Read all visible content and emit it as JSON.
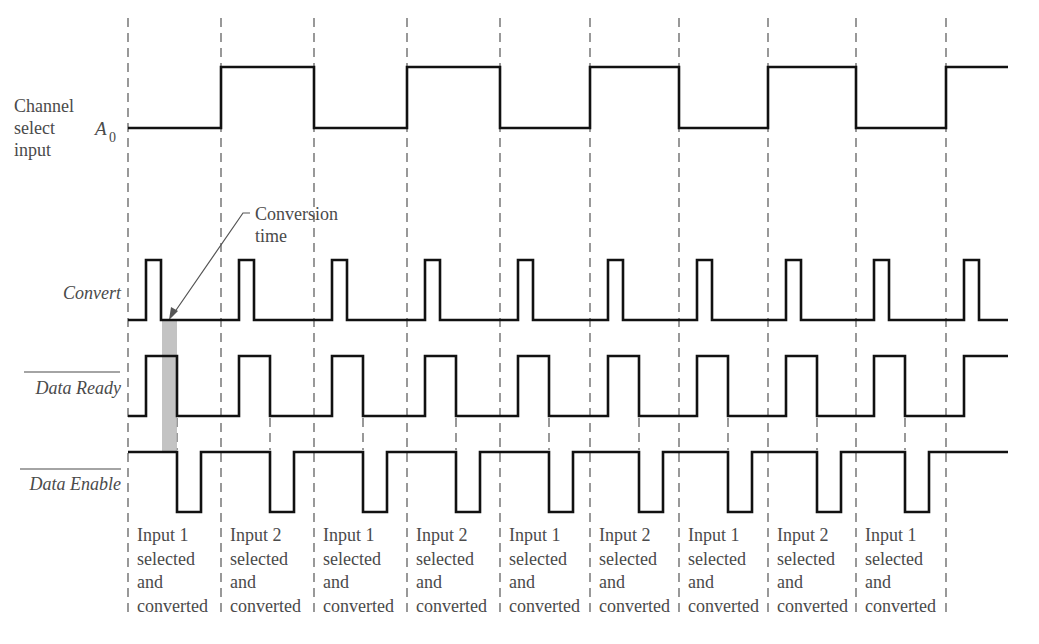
{
  "signals": [
    {
      "id": "a0",
      "label_lines": [
        "Channel",
        "select",
        "input"
      ],
      "symbol": "A",
      "symbol_sub": "0"
    },
    {
      "id": "convert",
      "label": "Convert"
    },
    {
      "id": "data_ready",
      "label": "Data Ready",
      "overbar": true
    },
    {
      "id": "data_enable",
      "label": "Data Enable",
      "overbar": true
    }
  ],
  "annotation": {
    "lines": [
      "Conversion",
      "time"
    ]
  },
  "slots": [
    {
      "lines": [
        "Input 1",
        "selected",
        "and",
        "converted"
      ]
    },
    {
      "lines": [
        "Input 2",
        "selected",
        "and",
        "converted"
      ]
    },
    {
      "lines": [
        "Input 1",
        "selected",
        "and",
        "converted"
      ]
    },
    {
      "lines": [
        "Input 2",
        "selected",
        "and",
        "converted"
      ]
    },
    {
      "lines": [
        "Input 1",
        "selected",
        "and",
        "converted"
      ]
    },
    {
      "lines": [
        "Input 2",
        "selected",
        "and",
        "converted"
      ]
    },
    {
      "lines": [
        "Input 1",
        "selected",
        "and",
        "converted"
      ]
    },
    {
      "lines": [
        "Input 2",
        "selected",
        "and",
        "converted"
      ]
    },
    {
      "lines": [
        "Input 1",
        "selected",
        "and",
        "converted"
      ]
    }
  ],
  "timing": {
    "period_boundaries_x": [
      128,
      221,
      314,
      407,
      500,
      590,
      679,
      768,
      856,
      946
    ],
    "end_x": 1008,
    "a0_sequence": [
      0,
      1,
      0,
      1,
      0,
      1,
      0,
      1,
      0,
      1
    ],
    "convert_offset": [
      18,
      33
    ],
    "data_ready_offset": [
      18,
      49
    ],
    "data_enable_low_offset": [
      49,
      73
    ]
  },
  "colors": {
    "waveform": "#111111",
    "dashed": "#555555",
    "text": "#4a4a4a",
    "conversion_bar": "#b9b9b9"
  }
}
